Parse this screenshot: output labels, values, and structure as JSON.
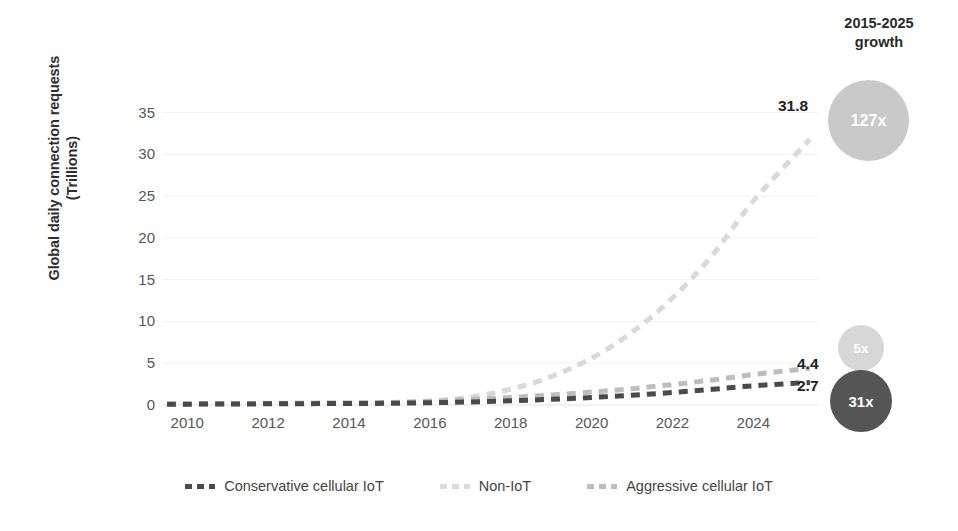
{
  "chart_data": {
    "type": "line",
    "title": "",
    "xlabel": "",
    "ylabel": "Global daily connection requests (Trillions)",
    "xlim": [
      2009.4,
      2025.6
    ],
    "ylim": [
      0,
      36.5
    ],
    "xticks": [
      2010,
      2012,
      2014,
      2016,
      2018,
      2020,
      2022,
      2024
    ],
    "yticks": [
      0,
      5,
      10,
      15,
      20,
      25,
      30,
      35
    ],
    "grid": true,
    "legend_position": "bottom",
    "x": [
      2009.5,
      2010,
      2011,
      2012,
      2013,
      2014,
      2015,
      2016,
      2017,
      2018,
      2019,
      2020,
      2021,
      2022,
      2023,
      2024,
      2025.4
    ],
    "series": [
      {
        "name": "Conservative cellular IoT",
        "color": "#4a4a4a",
        "style": "dashed",
        "end_label": "2.7",
        "growth_label": "31x",
        "values": [
          0.09,
          0.1,
          0.12,
          0.14,
          0.16,
          0.18,
          0.2,
          0.27,
          0.37,
          0.5,
          0.68,
          0.9,
          1.17,
          1.5,
          1.88,
          2.3,
          2.7
        ]
      },
      {
        "name": "Non-IoT",
        "color": "#d9d9d9",
        "style": "dashed",
        "end_label": "31.8",
        "growth_label": "127x",
        "values": [
          0.1,
          0.12,
          0.16,
          0.2,
          0.22,
          0.24,
          0.25,
          0.45,
          0.95,
          1.9,
          3.4,
          5.6,
          8.7,
          12.8,
          18.0,
          24.4,
          31.8
        ]
      },
      {
        "name": "Aggressive cellular IoT",
        "color": "#bdbdbd",
        "style": "dashed",
        "end_label": "4.4",
        "growth_label": "5x",
        "values": [
          0.1,
          0.12,
          0.15,
          0.18,
          0.21,
          0.25,
          0.3,
          0.45,
          0.65,
          0.9,
          1.2,
          1.55,
          1.95,
          2.45,
          3.0,
          3.65,
          4.4
        ]
      }
    ]
  },
  "growth_panel": {
    "title_line1": "2015-2025",
    "title_line2": "growth",
    "bubbles": [
      {
        "label": "127x",
        "color": "#c9c9c9",
        "text_color": "#ffffff"
      },
      {
        "label": "5x",
        "color": "#d7d7d7",
        "text_color": "#ffffff"
      },
      {
        "label": "31x",
        "color": "#555555",
        "text_color": "#ffffff"
      }
    ]
  },
  "legend": {
    "items": [
      {
        "label": "Conservative cellular IoT",
        "color": "#4a4a4a"
      },
      {
        "label": "Non-IoT",
        "color": "#dcdcdc"
      },
      {
        "label": "Aggressive cellular IoT",
        "color": "#bdbdbd"
      }
    ]
  },
  "end_labels": [
    {
      "text": "31.8"
    },
    {
      "text": "4.4"
    },
    {
      "text": "2.7"
    }
  ],
  "colors": {
    "background": "#ffffff",
    "gridline": "#f1f1f1",
    "axis": "#e3e3e3",
    "tick_text": "#575757",
    "title_text": "#2b2b2b"
  }
}
